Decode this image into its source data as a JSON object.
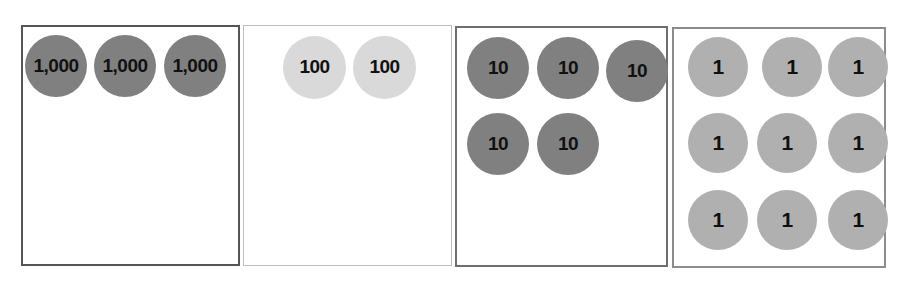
{
  "chart_data": {
    "type": "table",
    "total_value": 3259,
    "columns": [
      {
        "name": "thousands-column",
        "place_label": "1,000",
        "disk_text": "1,000",
        "count": 3,
        "value": 3000,
        "disk_color": "#808080",
        "border_color": "#555555",
        "border_width": 2
      },
      {
        "name": "hundreds-column",
        "place_label": "100",
        "disk_text": "100",
        "count": 2,
        "value": 200,
        "disk_color": "#d9d9d9",
        "border_color": "#bdbdbd",
        "border_width": 1
      },
      {
        "name": "tens-column",
        "place_label": "10",
        "disk_text": "10",
        "count": 5,
        "value": 50,
        "disk_color": "#808080",
        "border_color": "#6e6e6e",
        "border_width": 2
      },
      {
        "name": "ones-column",
        "place_label": "1",
        "disk_text": "1",
        "count": 9,
        "value": 9,
        "disk_color": "#b0b0b0",
        "border_color": "#8c8c8c",
        "border_width": 2
      }
    ],
    "boxes": [
      {
        "x": 21,
        "y": 25,
        "w": 219,
        "h": 241
      },
      {
        "x": 243,
        "y": 25,
        "w": 209,
        "h": 241
      },
      {
        "x": 455,
        "y": 26,
        "w": 213,
        "h": 241
      },
      {
        "x": 672,
        "y": 27,
        "w": 214,
        "h": 241
      }
    ],
    "disks": [
      {
        "column": 0,
        "text": "1,000",
        "x": 25,
        "y": 35,
        "size": "thousands"
      },
      {
        "column": 0,
        "text": "1,000",
        "x": 94,
        "y": 35,
        "size": "thousands"
      },
      {
        "column": 0,
        "text": "1,000",
        "x": 164,
        "y": 35,
        "size": "thousands"
      },
      {
        "column": 1,
        "text": "100",
        "x": 283,
        "y": 36,
        "size": "hundreds"
      },
      {
        "column": 1,
        "text": "100",
        "x": 353,
        "y": 36,
        "size": "hundreds"
      },
      {
        "column": 2,
        "text": "10",
        "x": 467,
        "y": 37,
        "size": "tens"
      },
      {
        "column": 2,
        "text": "10",
        "x": 537,
        "y": 37,
        "size": "tens"
      },
      {
        "column": 2,
        "text": "10",
        "x": 606,
        "y": 40,
        "size": "tens"
      },
      {
        "column": 2,
        "text": "10",
        "x": 467,
        "y": 113,
        "size": "tens"
      },
      {
        "column": 2,
        "text": "10",
        "x": 537,
        "y": 113,
        "size": "tens"
      },
      {
        "column": 3,
        "text": "1",
        "x": 688,
        "y": 37,
        "size": "ones"
      },
      {
        "column": 3,
        "text": "1",
        "x": 762,
        "y": 37,
        "size": "ones"
      },
      {
        "column": 3,
        "text": "1",
        "x": 828,
        "y": 37,
        "size": "ones"
      },
      {
        "column": 3,
        "text": "1",
        "x": 688,
        "y": 113,
        "size": "ones"
      },
      {
        "column": 3,
        "text": "1",
        "x": 757,
        "y": 113,
        "size": "ones"
      },
      {
        "column": 3,
        "text": "1",
        "x": 828,
        "y": 113,
        "size": "ones"
      },
      {
        "column": 3,
        "text": "1",
        "x": 688,
        "y": 190,
        "size": "ones"
      },
      {
        "column": 3,
        "text": "1",
        "x": 757,
        "y": 190,
        "size": "ones"
      },
      {
        "column": 3,
        "text": "1",
        "x": 828,
        "y": 190,
        "size": "ones"
      }
    ]
  },
  "canvas": {
    "width": 904,
    "height": 281,
    "background": "#ffffff"
  }
}
